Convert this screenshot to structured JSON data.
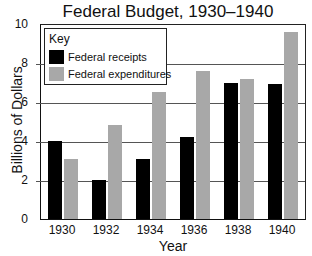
{
  "title": "Federal Budget, 1930–1940",
  "xlabel": "Year",
  "ylabel": "Billions of Dollars",
  "key": {
    "title": "Key",
    "items": [
      {
        "label": "Federal receipts",
        "color": "#000000"
      },
      {
        "label": "Federal expenditures",
        "color": "#a8a8a8"
      }
    ]
  },
  "yticks": [
    "0",
    "2",
    "4",
    "6",
    "8",
    "10"
  ],
  "xticks": [
    "1930",
    "1932",
    "1934",
    "1936",
    "1938",
    "1940"
  ],
  "chart_data": {
    "type": "bar",
    "title": "Federal Budget, 1930–1940",
    "xlabel": "Year",
    "ylabel": "Billions of Dollars",
    "categories": [
      "1930",
      "1932",
      "1934",
      "1936",
      "1938",
      "1940"
    ],
    "series": [
      {
        "name": "Federal receipts",
        "color": "#000000",
        "values": [
          4.0,
          2.0,
          3.1,
          4.2,
          7.0,
          6.9
        ]
      },
      {
        "name": "Federal expenditures",
        "color": "#a8a8a8",
        "values": [
          3.1,
          4.8,
          6.5,
          7.6,
          7.2,
          9.6
        ]
      }
    ],
    "ylim": [
      0,
      10
    ],
    "yticks": [
      0,
      2,
      4,
      6,
      8,
      10
    ],
    "grid": "horizontal",
    "legend_position": "upper-left, inside plot, titled 'Key'"
  }
}
